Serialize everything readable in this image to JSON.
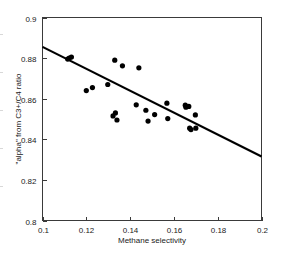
{
  "chart_data": {
    "type": "scatter",
    "title": "",
    "xlabel": "Methane selectivity",
    "ylabel": "\"alpha\" from C3+/C4 ratio",
    "xlim": [
      0.1,
      0.2
    ],
    "ylim": [
      0.8,
      0.9
    ],
    "xticks": [
      0.1,
      0.12,
      0.14,
      0.16,
      0.18,
      0.2
    ],
    "xtick_labels": [
      "0.1",
      "0.12",
      "0.14",
      "0.16",
      "0.18",
      "0.2"
    ],
    "yticks": [
      0.8,
      0.82,
      0.84,
      0.86,
      0.88,
      0.9
    ],
    "ytick_labels": [
      "0.8",
      "0.82",
      "0.84",
      "0.86",
      "0.88",
      "0.9"
    ],
    "grid": false,
    "legend": null,
    "marker": "filled-circle",
    "marker_color": "#000000",
    "series": [
      {
        "name": "samples",
        "points": [
          [
            0.1115,
            0.8795
          ],
          [
            0.1122,
            0.88
          ],
          [
            0.1132,
            0.8805
          ],
          [
            0.12,
            0.864
          ],
          [
            0.1228,
            0.8655
          ],
          [
            0.1298,
            0.867
          ],
          [
            0.1322,
            0.8515
          ],
          [
            0.133,
            0.879
          ],
          [
            0.1333,
            0.853
          ],
          [
            0.134,
            0.8495
          ],
          [
            0.1365,
            0.8762
          ],
          [
            0.1428,
            0.857
          ],
          [
            0.144,
            0.8752
          ],
          [
            0.1472,
            0.8543
          ],
          [
            0.1482,
            0.849
          ],
          [
            0.1512,
            0.8522
          ],
          [
            0.1568,
            0.8578
          ],
          [
            0.1572,
            0.8502
          ],
          [
            0.1652,
            0.8568
          ],
          [
            0.1655,
            0.8558
          ],
          [
            0.1668,
            0.8562
          ],
          [
            0.1672,
            0.8455
          ],
          [
            0.1678,
            0.8448
          ],
          [
            0.1698,
            0.852
          ],
          [
            0.17,
            0.8455
          ]
        ]
      }
    ],
    "trend_line": {
      "name": "linear-fit",
      "color": "#000000",
      "x_start": 0.1,
      "y_start": 0.8855,
      "x_end": 0.2,
      "y_end": 0.8315
    }
  },
  "axes": {
    "x_title": "Methane selectivity",
    "y_title": "\"alpha\" from C3+/C4 ratio"
  }
}
